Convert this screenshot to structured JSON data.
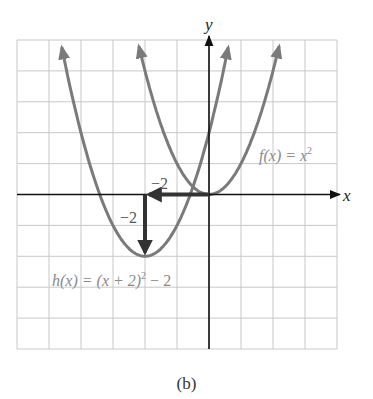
{
  "chart_data": {
    "type": "line",
    "title": "",
    "xlabel": "x",
    "ylabel": "y",
    "xlim": [
      -6,
      4
    ],
    "ylim": [
      -5,
      5
    ],
    "grid": true,
    "grid_step": 1,
    "series": [
      {
        "name": "f(x) = x^2",
        "label": "f(x) = x²",
        "expression": "x^2",
        "vertex": [
          0,
          0
        ],
        "x": [
          -2.24,
          -2,
          -1,
          0,
          1,
          2,
          2.24
        ],
        "y": [
          5,
          4,
          1,
          0,
          1,
          4,
          5
        ]
      },
      {
        "name": "h(x) = (x + 2)^2 - 2",
        "label": "h(x) = (x + 2)² − 2",
        "expression": "(x+2)^2-2",
        "vertex": [
          -2,
          -2
        ],
        "x": [
          -4.65,
          -4,
          -3,
          -2,
          -1,
          0,
          0.65
        ],
        "y": [
          5,
          2,
          -1,
          -2,
          -1,
          2,
          5
        ]
      }
    ],
    "annotations": [
      {
        "type": "arrow",
        "from": [
          0,
          0
        ],
        "to": [
          -2,
          0
        ],
        "label": "−2",
        "meaning": "horizontal shift left 2"
      },
      {
        "type": "arrow",
        "from": [
          -2,
          0
        ],
        "to": [
          -2,
          -2
        ],
        "label": "−2",
        "meaning": "vertical shift down 2"
      }
    ],
    "caption": "(b)"
  },
  "labels": {
    "x_axis": "x",
    "y_axis": "y",
    "f_label_prefix": "f(x) = x",
    "f_label_exp": "2",
    "h_label_prefix": "h(x) = (x + 2)",
    "h_label_exp": "2",
    "h_label_suffix": " − 2",
    "shift_h": "−2",
    "shift_v": "−2",
    "caption": "(b)"
  },
  "colors": {
    "grid": "#c8c8c8",
    "axis": "#111111",
    "curve": "#7a7a7a",
    "arrow": "#333333",
    "label": "#888888"
  }
}
